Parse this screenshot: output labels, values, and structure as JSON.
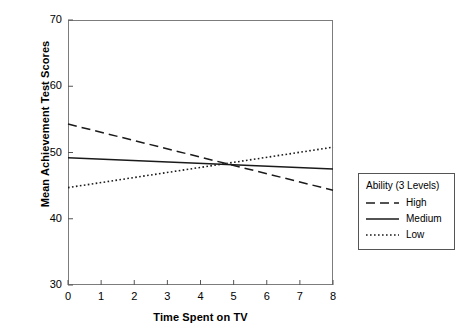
{
  "chart_data": {
    "type": "line",
    "title": "",
    "xlabel": "Time Spent on TV",
    "ylabel": "Mean Achievement Test Scores",
    "xlim": [
      0,
      8
    ],
    "ylim": [
      30,
      70
    ],
    "xticks": [
      "0",
      "1",
      "2",
      "3",
      "4",
      "5",
      "6",
      "7",
      "8"
    ],
    "yticks": [
      "30",
      "40",
      "50",
      "60",
      "70"
    ],
    "grid": false,
    "legend_position": "right-outside",
    "legend_title": "Ability (3 Levels)",
    "x": [
      0,
      8
    ],
    "series": [
      {
        "name": "High",
        "style": "dashed",
        "values": [
          54.3,
          44.3
        ]
      },
      {
        "name": "Medium",
        "style": "solid",
        "values": [
          49.2,
          47.5
        ]
      },
      {
        "name": "Low",
        "style": "dotted",
        "values": [
          44.7,
          50.8
        ]
      }
    ],
    "colors": {
      "line": "#1a1a1a",
      "frame": "#7c7c7c",
      "legend_border": "#555555",
      "background": "#ffffff"
    }
  }
}
